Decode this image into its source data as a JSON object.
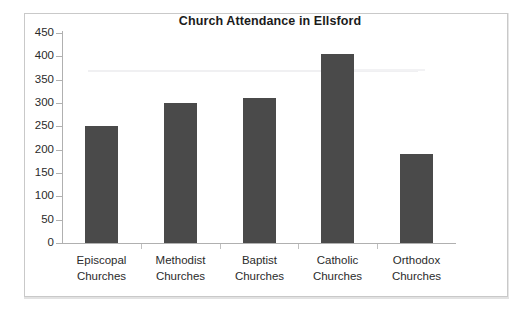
{
  "chart_data": {
    "type": "bar",
    "title": "Church Attendance in Ellsford",
    "xlabel": "",
    "ylabel": "",
    "categories": [
      "Episcopal Churches",
      "Methodist Churches",
      "Baptist Churches",
      "Catholic Churches",
      "Orthodox Churches"
    ],
    "category_lines": [
      [
        "Episcopal",
        "Churches"
      ],
      [
        "Methodist",
        "Churches"
      ],
      [
        "Baptist",
        "Churches"
      ],
      [
        "Catholic",
        "Churches"
      ],
      [
        "Orthodox",
        "Churches"
      ]
    ],
    "values": [
      250,
      300,
      310,
      405,
      190
    ],
    "ylim": [
      0,
      450
    ],
    "ytick_step": 50,
    "ytick_labels": [
      "450",
      "400",
      "350",
      "300",
      "250",
      "200",
      "150",
      "100",
      "50",
      "0"
    ],
    "ytick_values": [
      450,
      400,
      350,
      300,
      250,
      200,
      150,
      100,
      50,
      0
    ],
    "grid": false,
    "legend": false,
    "bar_color": "#4a4a4a",
    "axis_color": "#b0b0b0",
    "text_color": "#2a2a2a",
    "background": "#ffffff",
    "border_color": "#c9c9c9"
  }
}
